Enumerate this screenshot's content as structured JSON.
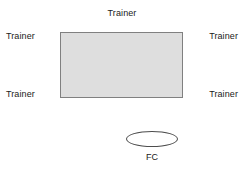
{
  "diagram": {
    "type": "training-room-layout",
    "arena": {
      "name": "central-room",
      "fill_color": "#dedede",
      "border_color": "#808080"
    },
    "labels": {
      "trainer_top": "Trainer",
      "trainer_top_left": "Trainer",
      "trainer_bottom_left": "Trainer",
      "trainer_top_right": "Trainer",
      "trainer_bottom_right": "Trainer",
      "fc": "FC"
    },
    "fc_node": {
      "name": "fc-ellipse",
      "shape": "ellipse",
      "fill_color": "#ffffff",
      "border_color": "#4d4d4d"
    }
  }
}
